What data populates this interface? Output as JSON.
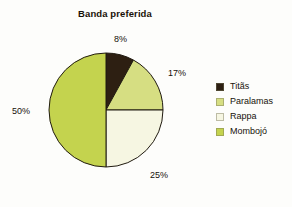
{
  "chart_data": {
    "type": "pie",
    "title": "Banda preferida",
    "xlabel": "",
    "ylabel": "",
    "categories": [
      "Titãs",
      "Paralamas",
      "Rappa",
      "Mombojó"
    ],
    "values": [
      8,
      17,
      25,
      50
    ],
    "value_labels": [
      "8%",
      "17%",
      "25%",
      "50%"
    ],
    "colors": [
      "#2d1f12",
      "#d6de82",
      "#f6f6e2",
      "#c4d34e"
    ],
    "start_angle": 90,
    "direction": "clockwise",
    "legend_position": "right",
    "grid": false,
    "slice_border_color": "#201a10"
  },
  "legend": {
    "items": [
      {
        "label": "Titãs",
        "color": "#2d1f12"
      },
      {
        "label": "Paralamas",
        "color": "#d6de82"
      },
      {
        "label": "Rappa",
        "color": "#f6f6e2"
      },
      {
        "label": "Mombojó",
        "color": "#c4d34e"
      }
    ]
  }
}
